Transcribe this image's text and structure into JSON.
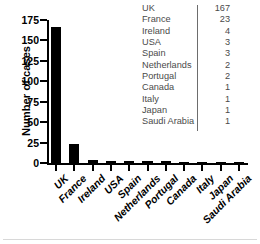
{
  "chart_data": {
    "type": "bar",
    "title": "",
    "xlabel": "",
    "ylabel": "Number of cases",
    "categories": [
      "UK",
      "France",
      "Ireland",
      "USA",
      "Spain",
      "Netherlands",
      "Portugal",
      "Canada",
      "Italy",
      "Japan",
      "Saudi Arabia"
    ],
    "values": [
      167,
      23,
      4,
      3,
      3,
      2,
      2,
      1,
      1,
      1,
      1
    ],
    "ylim": [
      0,
      175
    ],
    "yticks": [
      0,
      25,
      50,
      75,
      100,
      125,
      150,
      175
    ],
    "ytick_labels": [
      "0",
      "25",
      "50",
      "75",
      "100",
      "125",
      "150",
      "175"
    ],
    "grid": false,
    "legend": "none",
    "bar_color": "#000000"
  },
  "table": {
    "divider_color": "#6d6d6d",
    "rows": [
      {
        "country": "UK",
        "count": "167"
      },
      {
        "country": "France",
        "count": "23"
      },
      {
        "country": "Ireland",
        "count": "4"
      },
      {
        "country": "USA",
        "count": "3"
      },
      {
        "country": "Spain",
        "count": "3"
      },
      {
        "country": "Netherlands",
        "count": "2"
      },
      {
        "country": "Portugal",
        "count": "2"
      },
      {
        "country": "Canada",
        "count": "1"
      },
      {
        "country": "Italy",
        "count": "1"
      },
      {
        "country": "Japan",
        "count": "1"
      },
      {
        "country": "Saudi Arabia",
        "count": "1"
      }
    ]
  }
}
